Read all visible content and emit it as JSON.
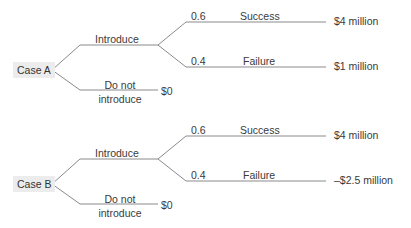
{
  "trees": [
    {
      "case_label": "Case A",
      "decision_options": [
        {
          "label": "Introduce",
          "outcomes": [
            {
              "probability": "0.6",
              "label": "Success",
              "payoff": "$4 million"
            },
            {
              "probability": "0.4",
              "label": "Failure",
              "payoff": "$1 million"
            }
          ]
        },
        {
          "label_line1": "Do not",
          "label_line2": "introduce",
          "payoff": "$0"
        }
      ]
    },
    {
      "case_label": "Case B",
      "decision_options": [
        {
          "label": "Introduce",
          "outcomes": [
            {
              "probability": "0.6",
              "label": "Success",
              "payoff": "$4 million"
            },
            {
              "probability": "0.4",
              "label": "Failure",
              "payoff": "–$2.5 million"
            }
          ]
        },
        {
          "label_line1": "Do not",
          "label_line2": "introduce",
          "payoff": "$0"
        }
      ]
    }
  ],
  "colors": {
    "line": "#8a8a8a",
    "box": "#ececec",
    "text": "#3a3a3a"
  }
}
